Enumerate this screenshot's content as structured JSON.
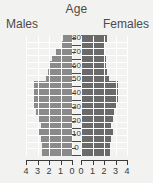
{
  "chart_data": {
    "type": "bar",
    "subtype": "population-pyramid",
    "title": "Age",
    "xlabel": "",
    "ylabel": "Age",
    "grid": true,
    "legend_position": "top",
    "xlim_left": [
      4,
      0
    ],
    "xlim_right": [
      0,
      4
    ],
    "ylim": [
      0,
      87.5
    ],
    "age_axis_ticks": [
      "0",
      "10",
      "20",
      "30",
      "40",
      "50",
      "60",
      "70",
      "80"
    ],
    "x_ticks_left": [
      "4",
      "3",
      "2",
      "1",
      "0"
    ],
    "x_ticks_right": [
      "0",
      "1",
      "2",
      "3",
      "4"
    ],
    "categories": [
      "0-4",
      "5-9",
      "10-14",
      "15-19",
      "20-24",
      "25-29",
      "30-34",
      "35-39",
      "40-44",
      "45-49",
      "50-54",
      "55-59",
      "60-64",
      "65-69",
      "70-74",
      "75-79",
      "80-84",
      "85+"
    ],
    "series": [
      {
        "name": "Males",
        "color": "#8a8a8a",
        "side": "left",
        "values": [
          2.6,
          2.6,
          2.7,
          3.0,
          2.7,
          3.0,
          3.1,
          3.3,
          3.3,
          3.3,
          3.3,
          2.3,
          2.1,
          1.9,
          1.7,
          1.4,
          1.0,
          0.8
        ]
      },
      {
        "name": "Females",
        "color": "#6a6a6a",
        "side": "right",
        "values": [
          2.5,
          2.5,
          2.6,
          2.8,
          2.6,
          2.8,
          2.9,
          3.1,
          3.2,
          3.2,
          3.2,
          2.4,
          2.3,
          2.2,
          2.2,
          2.1,
          2.0,
          2.3
        ]
      }
    ]
  },
  "labels": {
    "title_age": "Age",
    "males": "Males",
    "females": "Females"
  },
  "colors": {
    "background": "#f2f2f0",
    "male_bar": "#8a8a8a",
    "female_bar": "#6a6a6a",
    "gridline": "#ffffff",
    "axis": "#3a3a3a",
    "text": "#4a4a4a"
  }
}
